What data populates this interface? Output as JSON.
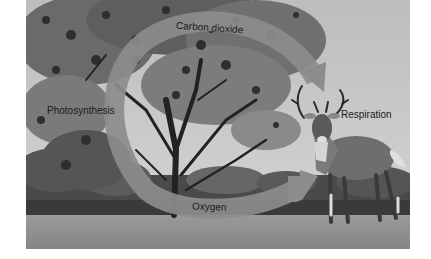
{
  "diagram": {
    "labels": {
      "carbon_dioxide": "Carbon dioxide",
      "oxygen": "Oxygen",
      "photosynthesis": "Photosynthesis",
      "respiration": "Respiration"
    },
    "flow": [
      {
        "from": "Respiration",
        "to": "Photosynthesis",
        "substance": "Carbon dioxide"
      },
      {
        "from": "Photosynthesis",
        "to": "Respiration",
        "substance": "Oxygen"
      }
    ],
    "elements": {
      "organism_left": "tree",
      "organism_right": "deer"
    },
    "colors": {
      "sky": "#c9c9c9",
      "arrow": "#8c8c8c",
      "foliage_dark": "#3a3a3a",
      "foliage_mid": "#6e6e6e",
      "grass": "#8f8f8f",
      "hedge": "#3c3c3c",
      "text": "#1a1a1a"
    }
  }
}
